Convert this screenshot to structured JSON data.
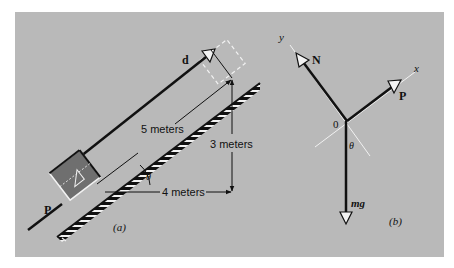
{
  "figure_a": {
    "caption": "(a)",
    "force_label": "P",
    "displacement_label": "d",
    "hypotenuse_label": "5 meters",
    "vertical_label": "3 meters",
    "horizontal_label": "4 meters",
    "angle_label": "θ"
  },
  "figure_b": {
    "caption": "(b)",
    "normal_label": "N",
    "force_label": "P",
    "weight_label": "mg",
    "origin_label": "0",
    "x_axis_label": "x",
    "y_axis_label": "y",
    "angle_label": "θ"
  },
  "colors": {
    "background": "#b9b9b9",
    "ink": "#111111",
    "block_fill": "#6f6f6f",
    "highlight": "#f2f2f2"
  }
}
